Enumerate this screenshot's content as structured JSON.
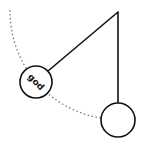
{
  "diagram": {
    "type": "pendulum",
    "colors": {
      "stroke": "#111111",
      "arc": "#666666",
      "background": "#ffffff"
    },
    "pivot": {
      "x": 118,
      "y": 12
    },
    "swung_bob": {
      "label": "god",
      "cx": 36,
      "cy": 82,
      "r": 16
    },
    "rest_bob": {
      "label": "",
      "cx": 118,
      "cy": 120,
      "r": 17
    }
  }
}
